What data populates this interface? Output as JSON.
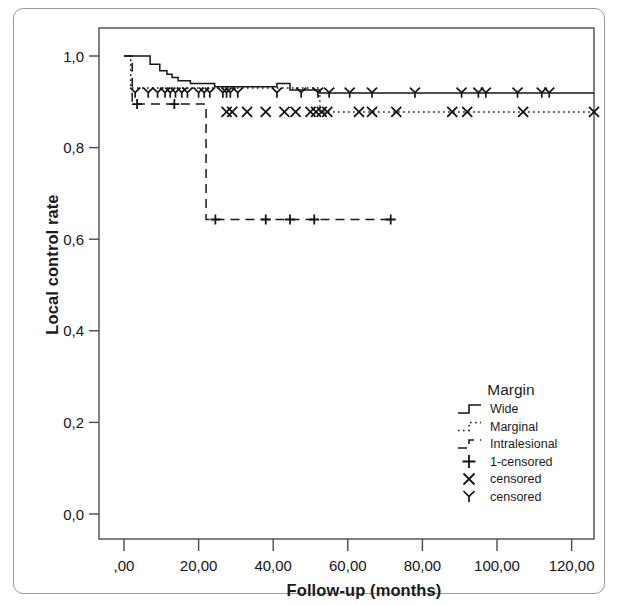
{
  "figure": {
    "y_axis_title": "Local control rate",
    "x_axis_title": "Follow-up (months)"
  },
  "axes": {
    "y_ticks": [
      "1,0",
      "0,8",
      "0,6",
      "0,4",
      "0,2",
      "0,0"
    ],
    "x_ticks": [
      ",00",
      "20,00",
      "40,00",
      "60,00",
      "80,00",
      "100,00",
      "120,00"
    ]
  },
  "legend": {
    "title": "Margin",
    "items": [
      {
        "label": "Wide",
        "symbol": "solid-step-line"
      },
      {
        "label": "Marginal",
        "symbol": "dotted-step-line"
      },
      {
        "label": "Intralesional",
        "symbol": "dashed-step-line"
      },
      {
        "label": "1-censored",
        "symbol": "plus-marker"
      },
      {
        "label": "censored",
        "symbol": "x-marker"
      },
      {
        "label": "censored",
        "symbol": "y-marker"
      }
    ]
  },
  "chart_data": {
    "type": "line",
    "title": "",
    "xlabel": "Follow-up (months)",
    "ylabel": "Local control rate",
    "xlim": [
      0,
      126
    ],
    "ylim": [
      0.0,
      1.0
    ],
    "xticks": [
      0,
      20,
      40,
      60,
      80,
      100,
      120
    ],
    "yticks": [
      0.0,
      0.2,
      0.4,
      0.6,
      0.8,
      1.0
    ],
    "grid": false,
    "legend_position": "lower-right",
    "plot_kind": "kaplan-meier-survival",
    "series": [
      {
        "name": "Wide",
        "style": "solid",
        "censor_symbol": "y-marker",
        "steps": [
          [
            0,
            1.0
          ],
          [
            3.0,
            1.0
          ],
          [
            6.8,
            1.0
          ],
          [
            7.0,
            0.982
          ],
          [
            9.3,
            0.982
          ],
          [
            9.6,
            0.968
          ],
          [
            11.2,
            0.968
          ],
          [
            11.5,
            0.96
          ],
          [
            12.6,
            0.96
          ],
          [
            12.9,
            0.953
          ],
          [
            14.2,
            0.953
          ],
          [
            14.5,
            0.946
          ],
          [
            17.5,
            0.946
          ],
          [
            17.8,
            0.94
          ],
          [
            24.0,
            0.94
          ],
          [
            24.3,
            0.933
          ],
          [
            40.5,
            0.933
          ],
          [
            41.0,
            0.94
          ],
          [
            44.0,
            0.94
          ],
          [
            44.5,
            0.926
          ],
          [
            52.0,
            0.926
          ],
          [
            52.5,
            0.919
          ],
          [
            126.0,
            0.919
          ]
        ],
        "censor_times": [
          3.0,
          6.5,
          9.0,
          11.0,
          12.4,
          13.8,
          15.5,
          17.0,
          20.0,
          21.5,
          23.0,
          26.5,
          27.5,
          28.5,
          30.5,
          41.0,
          47.5,
          52.0,
          55.0,
          60.5,
          66.5,
          78.0,
          90.5,
          95.0,
          97.0,
          105.5,
          112.0,
          114.0
        ],
        "censor_value": 0.92
      },
      {
        "name": "Marginal",
        "style": "dotted",
        "censor_symbol": "x-marker",
        "steps": [
          [
            0,
            1.0
          ],
          [
            1.5,
            1.0
          ],
          [
            1.8,
            0.93
          ],
          [
            27.0,
            0.93
          ],
          [
            27.5,
            0.93
          ],
          [
            52.0,
            0.93
          ],
          [
            52.5,
            0.878
          ],
          [
            126.0,
            0.878
          ]
        ],
        "censor_times": [
          27.5,
          29.0,
          33.0,
          38.0,
          43.0,
          46.0,
          50.0,
          51.5,
          53.0,
          54.5,
          63.0,
          66.5,
          73.0,
          88.0,
          92.0,
          107.0,
          126.0
        ],
        "censor_value": 0.878
      },
      {
        "name": "Intralesional",
        "style": "dashed",
        "censor_symbol": "plus-marker",
        "steps": [
          [
            0,
            1.0
          ],
          [
            2.0,
            1.0
          ],
          [
            2.2,
            0.895
          ],
          [
            21.8,
            0.895
          ],
          [
            22.0,
            0.643
          ],
          [
            72.0,
            0.643
          ]
        ],
        "censor_times_upper": [
          3.5,
          13.5
        ],
        "censor_upper_value": 0.895,
        "censor_times_lower": [
          24.5,
          38.0,
          44.5,
          51.0,
          71.5
        ],
        "censor_lower_value": 0.643
      }
    ]
  }
}
